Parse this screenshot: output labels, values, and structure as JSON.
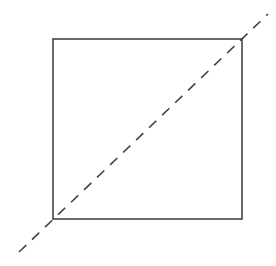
{
  "diagram": {
    "width": 276,
    "height": 266,
    "background": "#ffffff",
    "stroke_color": "#444444",
    "square": {
      "x": 53,
      "y": 39,
      "width": 189,
      "height": 180,
      "stroke_width": 1.6
    },
    "diagonal": {
      "x1": 19,
      "y1": 252,
      "x2": 268,
      "y2": 14,
      "dash": "10 8",
      "stroke_width": 1.6
    }
  }
}
